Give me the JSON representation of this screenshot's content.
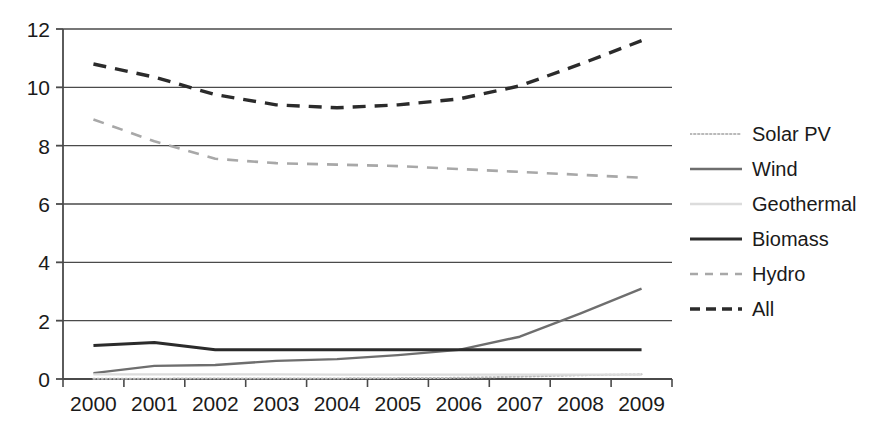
{
  "chart_data": {
    "type": "line",
    "title": "",
    "xlabel": "",
    "ylabel": "",
    "categories": [
      "2000",
      "2001",
      "2002",
      "2003",
      "2004",
      "2005",
      "2006",
      "2007",
      "2008",
      "2009"
    ],
    "x": [
      2000,
      2001,
      2002,
      2003,
      2004,
      2005,
      2006,
      2007,
      2008,
      2009
    ],
    "ylim": [
      0,
      12
    ],
    "yticks": [
      0,
      2,
      4,
      6,
      8,
      10,
      12
    ],
    "ytick_labels": [
      "0",
      "2",
      "4",
      "6",
      "8",
      "10",
      "12"
    ],
    "grid": true,
    "grid_axis": "y",
    "legend_position": "right",
    "series": [
      {
        "name": "Solar PV",
        "values": [
          0.01,
          0.01,
          0.02,
          0.02,
          0.02,
          0.03,
          0.04,
          0.08,
          0.13,
          0.16
        ],
        "style": "dotted",
        "color": "#b9b9b9",
        "width": 2
      },
      {
        "name": "Wind",
        "values": [
          0.2,
          0.45,
          0.48,
          0.62,
          0.68,
          0.82,
          1.0,
          1.45,
          2.25,
          3.1
        ],
        "style": "solid",
        "color": "#6e6e6e",
        "width": 2.4
      },
      {
        "name": "Geothermal",
        "values": [
          0.16,
          0.16,
          0.16,
          0.16,
          0.15,
          0.15,
          0.15,
          0.15,
          0.15,
          0.15
        ],
        "style": "solid",
        "color": "#dcdcdc",
        "width": 2.4
      },
      {
        "name": "Biomass",
        "values": [
          1.15,
          1.25,
          1.0,
          1.0,
          1.0,
          1.0,
          1.0,
          1.0,
          1.0,
          1.0
        ],
        "style": "solid",
        "color": "#2b2b2b",
        "width": 3
      },
      {
        "name": "Hydro",
        "values": [
          8.9,
          8.15,
          7.55,
          7.4,
          7.35,
          7.3,
          7.2,
          7.1,
          7.0,
          6.9
        ],
        "style": "dashed",
        "color": "#a8a8a8",
        "width": 2.6
      },
      {
        "name": "All",
        "values": [
          10.8,
          10.35,
          9.75,
          9.4,
          9.3,
          9.4,
          9.6,
          10.05,
          10.8,
          11.6
        ],
        "style": "dashed",
        "color": "#2b2b2b",
        "width": 3.4
      }
    ]
  },
  "legend": {
    "items": [
      {
        "label": "Solar PV"
      },
      {
        "label": "Wind"
      },
      {
        "label": "Geothermal"
      },
      {
        "label": "Biomass"
      },
      {
        "label": "Hydro"
      },
      {
        "label": "All"
      }
    ]
  },
  "colors": {
    "axis": "#4a4a4a",
    "grid": "#4a4a4a",
    "text": "#1a1a1a",
    "background": "#ffffff"
  }
}
